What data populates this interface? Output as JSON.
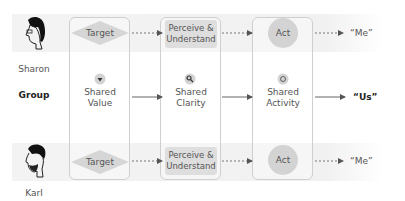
{
  "people": [
    {
      "name": "Sharon"
    },
    {
      "name": "Karl"
    }
  ],
  "group_label": "Group",
  "stages": {
    "target": "Target",
    "perceive": "Perceive & Understand",
    "perceive_line1": "Perceive &",
    "perceive_line2": "Understand",
    "act": "Act"
  },
  "shared": [
    {
      "line1": "Shared",
      "line2": "Value",
      "icon": "heart-icon"
    },
    {
      "line1": "Shared",
      "line2": "Clarity",
      "icon": "magnifier-icon"
    },
    {
      "line1": "Shared",
      "line2": "Activity",
      "icon": "target-ring-icon"
    }
  ],
  "outcomes": {
    "individual": "“Me”",
    "group": "“Us”"
  },
  "colors": {
    "band": "#f2f2f2",
    "box_border": "#cfcfcf",
    "node_fill": "#d3d3d3",
    "arrow": "#666666"
  }
}
